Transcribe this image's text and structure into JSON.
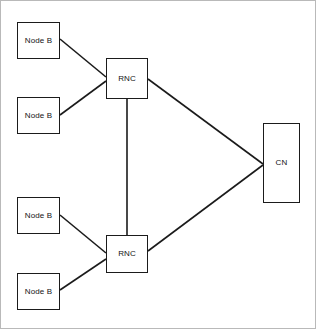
{
  "diagram": {
    "canvas": {
      "width": 316,
      "height": 329,
      "background": "#ffffff",
      "border_color": "#b9b9b9"
    },
    "style": {
      "node_border_color": "#1b1b1b",
      "node_fill": "#ffffff",
      "edge_color": "#1b1b1b",
      "label_color": "#141414"
    },
    "nodes": [
      {
        "id": "nodeb-1",
        "label": "Node B",
        "x": 16,
        "y": 21,
        "width": 43,
        "height": 37
      },
      {
        "id": "nodeb-2",
        "label": "Node B",
        "x": 16,
        "y": 96,
        "width": 43,
        "height": 37
      },
      {
        "id": "nodeb-3",
        "label": "Node B",
        "x": 16,
        "y": 196,
        "width": 43,
        "height": 37
      },
      {
        "id": "nodeb-4",
        "label": "Node B",
        "x": 16,
        "y": 272,
        "width": 43,
        "height": 37
      },
      {
        "id": "rnc-1",
        "label": "RNC",
        "x": 105,
        "y": 57,
        "width": 42,
        "height": 41
      },
      {
        "id": "rnc-2",
        "label": "RNC",
        "x": 105,
        "y": 234,
        "width": 42,
        "height": 38
      },
      {
        "id": "cn-1",
        "label": "CN",
        "x": 262,
        "y": 122,
        "width": 37,
        "height": 80
      }
    ],
    "edges": [
      {
        "id": "edge-nodeb1-rnc1",
        "from": "nodeb-1",
        "to": "rnc-1",
        "x1": 59,
        "y1": 38,
        "x2": 105,
        "y2": 76
      },
      {
        "id": "edge-nodeb2-rnc1",
        "from": "nodeb-2",
        "to": "rnc-1",
        "x1": 59,
        "y1": 114,
        "x2": 105,
        "y2": 80
      },
      {
        "id": "edge-rnc1-rnc2",
        "from": "rnc-1",
        "to": "rnc-2",
        "x1": 126,
        "y1": 98,
        "x2": 126,
        "y2": 234
      },
      {
        "id": "edge-rnc1-cn",
        "from": "rnc-1",
        "to": "cn-1",
        "x1": 147,
        "y1": 78,
        "x2": 262,
        "y2": 163
      },
      {
        "id": "edge-nodeb3-rnc2",
        "from": "nodeb-3",
        "to": "rnc-2",
        "x1": 59,
        "y1": 214,
        "x2": 105,
        "y2": 252
      },
      {
        "id": "edge-nodeb4-rnc2",
        "from": "nodeb-4",
        "to": "rnc-2",
        "x1": 59,
        "y1": 289,
        "x2": 105,
        "y2": 258
      },
      {
        "id": "edge-rnc2-cn",
        "from": "rnc-2",
        "to": "cn-1",
        "x1": 147,
        "y1": 250,
        "x2": 262,
        "y2": 164
      }
    ]
  }
}
